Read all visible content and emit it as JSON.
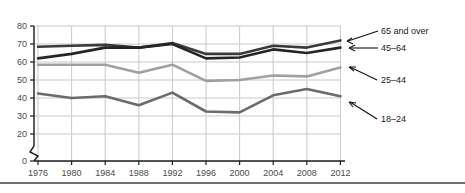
{
  "chart_data": {
    "type": "line",
    "title": "",
    "subtitle": "",
    "xlabel": "",
    "ylabel": "",
    "x": [
      1976,
      1980,
      1984,
      1988,
      1992,
      1996,
      2000,
      2004,
      2008,
      2012
    ],
    "xtick_labels": [
      "1976",
      "1980",
      "1984",
      "1988",
      "1992",
      "1996",
      "2000",
      "2004",
      "2008",
      "2012"
    ],
    "ytick_labels": [
      "0",
      "20",
      "30",
      "40",
      "50",
      "60",
      "70",
      "80"
    ],
    "ytick_values": [
      0,
      20,
      30,
      40,
      50,
      60,
      70,
      80
    ],
    "ylim": [
      20,
      80
    ],
    "y_axis_break": true,
    "grid": true,
    "legend_position": "right-inline-annotations",
    "series": [
      {
        "name": "65 and over",
        "color": "#3a3a3a",
        "values": [
          68.5,
          69.0,
          69.5,
          68.0,
          70.5,
          64.5,
          64.5,
          69.0,
          68.0,
          72.0
        ]
      },
      {
        "name": "45–64",
        "color": "#252525",
        "values": [
          62.0,
          64.5,
          68.0,
          68.0,
          70.0,
          62.0,
          62.5,
          67.0,
          65.0,
          68.0
        ]
      },
      {
        "name": "25–44",
        "color": "#a0a0a0",
        "values": [
          58.5,
          58.5,
          58.5,
          54.0,
          58.5,
          49.5,
          50.0,
          52.5,
          52.0,
          57.0
        ]
      },
      {
        "name": "18–24",
        "color": "#6b6b6b",
        "values": [
          42.5,
          40.0,
          41.0,
          36.0,
          43.0,
          32.5,
          32.0,
          41.5,
          45.0,
          41.0
        ]
      }
    ]
  },
  "annotations": [
    {
      "label": "65 and over"
    },
    {
      "label": "45–64"
    },
    {
      "label": "25–44"
    },
    {
      "label": "18–24"
    }
  ]
}
